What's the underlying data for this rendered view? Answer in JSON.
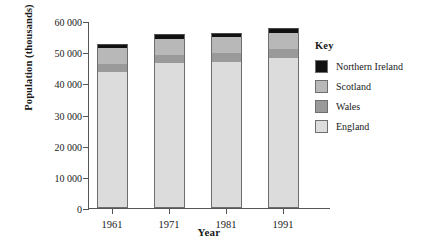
{
  "chart_data": {
    "type": "bar",
    "stacked": true,
    "title": "",
    "xlabel": "Year",
    "ylabel": "Population (thousands)",
    "categories": [
      "1961",
      "1971",
      "1981",
      "1991"
    ],
    "ylim": [
      0,
      60000
    ],
    "ytick_labels": [
      "0",
      "10 000",
      "20 000",
      "30 000",
      "40 000",
      "50 000",
      "60 000"
    ],
    "ytick_values": [
      0,
      10000,
      20000,
      30000,
      40000,
      50000,
      60000
    ],
    "grid": false,
    "legend_position": "right",
    "legend_title": "Key",
    "series": [
      {
        "name": "England",
        "color": "#dcdcdc",
        "values": [
          43500,
          46400,
          46800,
          48200
        ]
      },
      {
        "name": "Wales",
        "color": "#9a9a9a",
        "values": [
          2650,
          2750,
          2800,
          2900
        ]
      },
      {
        "name": "Scotland",
        "color": "#b8b8b8",
        "values": [
          5180,
          5230,
          5150,
          5100
        ]
      },
      {
        "name": "Northern Ireland",
        "color": "#111111",
        "values": [
          1420,
          1540,
          1560,
          1600
        ]
      }
    ],
    "totals": [
      52750,
      55920,
      56310,
      57800
    ],
    "legend_order": [
      "Northern Ireland",
      "Scotland",
      "Wales",
      "England"
    ]
  }
}
